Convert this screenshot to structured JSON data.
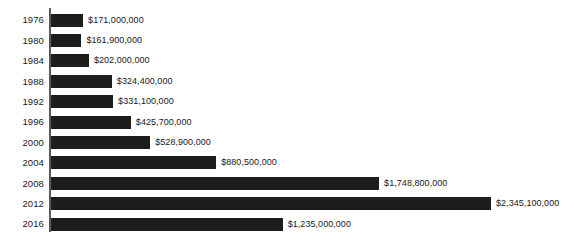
{
  "chart_data": {
    "type": "bar",
    "orientation": "horizontal",
    "title": "",
    "subtitle": "",
    "xlabel": "",
    "ylabel": "",
    "legend": [],
    "legend_position": "none",
    "grid": false,
    "axis": {
      "y_axis_visible": true,
      "x_axis_visible": false,
      "x_ticks": [],
      "y_ticks": [
        "1976",
        "1980",
        "1984",
        "1988",
        "1992",
        "1996",
        "2000",
        "2004",
        "2008",
        "2012",
        "2016"
      ],
      "xlim": [
        0,
        2345100000
      ]
    },
    "categories": [
      "1976",
      "1980",
      "1984",
      "1988",
      "1992",
      "1996",
      "2000",
      "2004",
      "2008",
      "2012",
      "2016"
    ],
    "values": [
      171000000,
      161900000,
      202000000,
      324400000,
      331100000,
      425700000,
      528900000,
      880500000,
      1748800000,
      2345100000,
      1235000000
    ],
    "value_labels": [
      "$171,000,000",
      "$161,900,000",
      "$202,000,000",
      "$324,400,000",
      "$331,100,000",
      "$425,700,000",
      "$528,900,000",
      "$880,500,000",
      "$1,748,800,000",
      "$2,345,100,000",
      "$1,235,000,000"
    ],
    "bar_color": "#1d1d1b",
    "axis_color": "#58595b",
    "background_color": "#ffffff",
    "rows": [
      {
        "year": "1976",
        "value": 171000000,
        "label": "$171,000,000"
      },
      {
        "year": "1980",
        "value": 161900000,
        "label": "$161,900,000"
      },
      {
        "year": "1984",
        "value": 202000000,
        "label": "$202,000,000"
      },
      {
        "year": "1988",
        "value": 324400000,
        "label": "$324,400,000"
      },
      {
        "year": "1992",
        "value": 331100000,
        "label": "$331,100,000"
      },
      {
        "year": "1996",
        "value": 425700000,
        "label": "$425,700,000"
      },
      {
        "year": "2000",
        "value": 528900000,
        "label": "$528,900,000"
      },
      {
        "year": "2004",
        "value": 880500000,
        "label": "$880,500,000"
      },
      {
        "year": "2008",
        "value": 1748800000,
        "label": "$1,748,800,000"
      },
      {
        "year": "2012",
        "value": 2345100000,
        "label": "$2,345,100,000"
      },
      {
        "year": "2016",
        "value": 1235000000,
        "label": "$1,235,000,000"
      }
    ]
  }
}
